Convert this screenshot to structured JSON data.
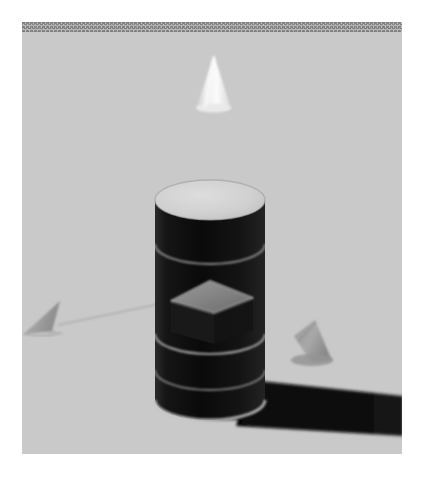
{
  "image": {
    "title": "Rendered 3D shape scene",
    "kind": "3d-render",
    "width_px": 423,
    "height_px": 479,
    "canvas": {
      "left": 22,
      "top": 22,
      "width": 380,
      "height": 432
    },
    "border": "white page margin",
    "style_notes": "grayscale, heavy sensor noise, slight blur",
    "colors": {
      "background": "#c9c9c9",
      "background_light": "#d4d4d4",
      "background_dark": "#bdbdbd",
      "cylinder_body": "#111111",
      "cylinder_top": "#d2d2d2",
      "cylinder_rim": "#cfcfcf",
      "wireframe_line": "#b9b9b9",
      "cube_face": "#8e8e8e",
      "cone_white": "#f4f4f4",
      "cone_gray": "#a0a0a0",
      "shadow": "#0c0c0c",
      "thread_line": "#b0b0b0",
      "page": "#ffffff"
    }
  },
  "objects": [
    {
      "id": "top-cone",
      "name": "floating-white-cone",
      "shape": "cone",
      "color": "white",
      "size": "small",
      "material": "matte",
      "position_px": {
        "x": 212,
        "y": 82
      },
      "bbox_px": {
        "x": 196,
        "y": 55,
        "w": 33,
        "h": 54
      },
      "state": "floating"
    },
    {
      "id": "center-cylinder",
      "name": "large-dark-cylinder",
      "shape": "cylinder",
      "color": "black",
      "size": "large",
      "material": "matte",
      "position_px": {
        "x": 210,
        "y": 285
      },
      "bbox_px": {
        "x": 155,
        "y": 163,
        "w": 112,
        "h": 240
      },
      "state": "standing",
      "overlays": [
        "horizontal wireframe bands",
        "vertical seam lines"
      ]
    },
    {
      "id": "overlay-cube",
      "name": "gray-cube-on-cylinder",
      "shape": "cube",
      "color": "gray",
      "size": "small",
      "material": "matte",
      "position_px": {
        "x": 211,
        "y": 300
      },
      "bbox_px": {
        "x": 171,
        "y": 281,
        "w": 82,
        "h": 62
      },
      "state": "intersecting-cylinder"
    },
    {
      "id": "left-cone",
      "name": "left-gray-cone",
      "shape": "cone",
      "color": "gray",
      "size": "small",
      "material": "matte",
      "position_px": {
        "x": 43,
        "y": 318
      },
      "bbox_px": {
        "x": 23,
        "y": 301,
        "w": 41,
        "h": 33
      },
      "state": "on-ground"
    },
    {
      "id": "right-cone",
      "name": "right-gray-cone",
      "shape": "cone",
      "color": "gray",
      "size": "small",
      "material": "matte",
      "position_px": {
        "x": 312,
        "y": 342
      },
      "bbox_px": {
        "x": 293,
        "y": 320,
        "w": 39,
        "h": 42
      },
      "state": "on-ground"
    },
    {
      "id": "cylinder-shadow",
      "name": "cast-shadow",
      "shape": "shadow",
      "color": "black",
      "position_px": {
        "x": 320,
        "y": 408
      },
      "bbox_px": {
        "x": 255,
        "y": 378,
        "w": 148,
        "h": 58
      },
      "state": "cast-to-right"
    },
    {
      "id": "thread-line",
      "name": "thin-connector-line",
      "shape": "line",
      "color": "gray",
      "from_px": {
        "x": 58,
        "y": 325
      },
      "to_px": {
        "x": 173,
        "y": 300
      },
      "state": "faint"
    }
  ],
  "scene_summary": {
    "object_count": 5,
    "shapes": [
      "cone",
      "cylinder",
      "cube",
      "cone",
      "cone"
    ],
    "lighting": "top-left key light",
    "shadow_direction": "right"
  }
}
